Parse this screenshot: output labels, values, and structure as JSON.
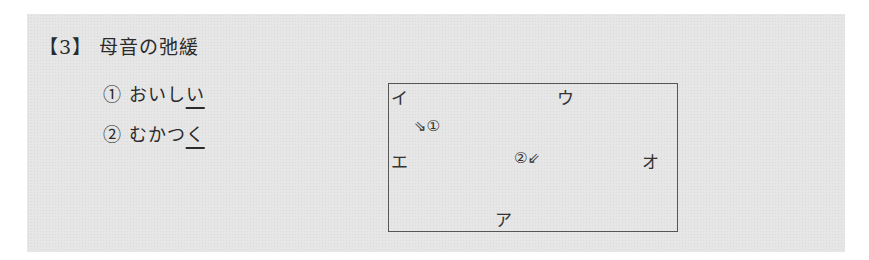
{
  "heading": {
    "bracket_open": "【",
    "number": "3",
    "bracket_close": "】",
    "title": "母音の弛緩"
  },
  "items": [
    {
      "marker": "①",
      "prefix": "おいし",
      "underlined": "い"
    },
    {
      "marker": "②",
      "prefix": "むかつ",
      "underlined": "く"
    }
  ],
  "diagram": {
    "vowels": {
      "i": "イ",
      "u": "ウ",
      "e": "エ",
      "o": "オ",
      "a": "ア"
    },
    "label1": "⇘①",
    "label2": "②⇙"
  }
}
